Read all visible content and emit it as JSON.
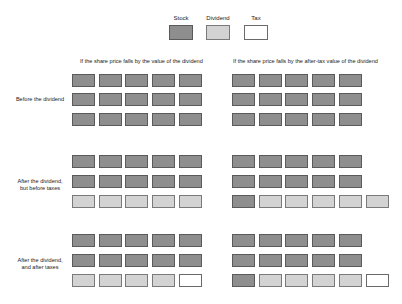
{
  "legend": {
    "items": [
      {
        "key": "stock",
        "label": "Stock",
        "color": "#8e8e8e"
      },
      {
        "key": "dividend",
        "label": "Dividend",
        "color": "#d3d3d3"
      },
      {
        "key": "tax",
        "label": "Tax",
        "color": "#ffffff"
      }
    ]
  },
  "columns": [
    {
      "title": "If the share price falls by the value of the dividend"
    },
    {
      "title": "If the share price falls by the after-tax value of the dividend"
    }
  ],
  "rows": [
    {
      "label": "Before the dividend"
    },
    {
      "label_line1": "After the dividend,",
      "label_line2": "but before taxes"
    },
    {
      "label_line1": "After the dividend,",
      "label_line2": "and after taxes"
    }
  ],
  "grids": {
    "left": [
      [
        [
          "stock",
          "stock",
          "stock",
          "stock",
          "stock"
        ],
        [
          "stock",
          "stock",
          "stock",
          "stock",
          "stock"
        ],
        [
          "stock",
          "stock",
          "stock",
          "stock",
          "stock"
        ]
      ],
      [
        [
          "stock",
          "stock",
          "stock",
          "stock",
          "stock"
        ],
        [
          "stock",
          "stock",
          "stock",
          "stock",
          "stock"
        ],
        [
          "dividend",
          "dividend",
          "dividend",
          "dividend",
          "dividend"
        ]
      ],
      [
        [
          "stock",
          "stock",
          "stock",
          "stock",
          "stock"
        ],
        [
          "stock",
          "stock",
          "stock",
          "stock",
          "stock"
        ],
        [
          "dividend",
          "dividend",
          "dividend",
          "dividend",
          "tax"
        ]
      ]
    ],
    "right": [
      [
        [
          "stock",
          "stock",
          "stock",
          "stock",
          "stock"
        ],
        [
          "stock",
          "stock",
          "stock",
          "stock",
          "stock"
        ],
        [
          "stock",
          "stock",
          "stock",
          "stock",
          "stock"
        ]
      ],
      [
        [
          "stock",
          "stock",
          "stock",
          "stock",
          "stock"
        ],
        [
          "stock",
          "stock",
          "stock",
          "stock",
          "stock"
        ],
        [
          "stock",
          "dividend",
          "dividend",
          "dividend",
          "dividend",
          "dividend"
        ]
      ],
      [
        [
          "stock",
          "stock",
          "stock",
          "stock",
          "stock"
        ],
        [
          "stock",
          "stock",
          "stock",
          "stock",
          "stock"
        ],
        [
          "stock",
          "dividend",
          "dividend",
          "dividend",
          "dividend",
          "tax"
        ]
      ]
    ]
  }
}
